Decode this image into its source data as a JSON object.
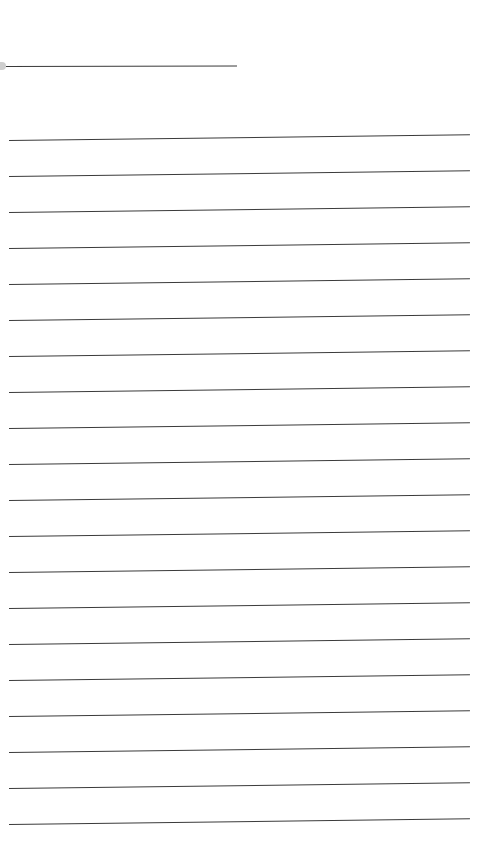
{
  "document": {
    "type": "lined-paper",
    "header_line": {
      "x": 6,
      "y": 66,
      "width": 231
    },
    "ruled_lines": {
      "count": 20,
      "first_y": 140,
      "spacing": 36,
      "x": 9,
      "width": 461
    },
    "line_color": "#3a3a3a",
    "background": "#ffffff"
  }
}
